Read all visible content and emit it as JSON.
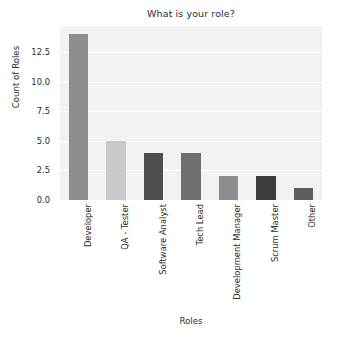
{
  "chart_data": {
    "type": "bar",
    "title": "What is your role?",
    "xlabel": "Roles",
    "ylabel": "Count of Roles",
    "categories": [
      "Developer",
      "QA - Tester",
      "Software Analyst",
      "Tech Lead",
      "Development Manager",
      "Scrum Master",
      "Other"
    ],
    "values": [
      14,
      5,
      4,
      4,
      2,
      2,
      1
    ],
    "bar_colors": [
      "#8d8d8d",
      "#c9c9c9",
      "#4f4f4f",
      "#6e6e6e",
      "#8d8d8d",
      "#3c3c3c",
      "#5e5e5e"
    ],
    "ylim": [
      0,
      14.7
    ],
    "yticks": [
      "0.0",
      "2.5",
      "5.0",
      "7.5",
      "10.0",
      "12.5"
    ],
    "ytick_values": [
      0,
      2.5,
      5,
      7.5,
      10,
      12.5
    ],
    "grid": true,
    "grid_color": "#ffffff",
    "plot_background": "#f2f2f2",
    "figure_background": "#ffffff",
    "legend": null,
    "xtick_rotation": -90
  }
}
